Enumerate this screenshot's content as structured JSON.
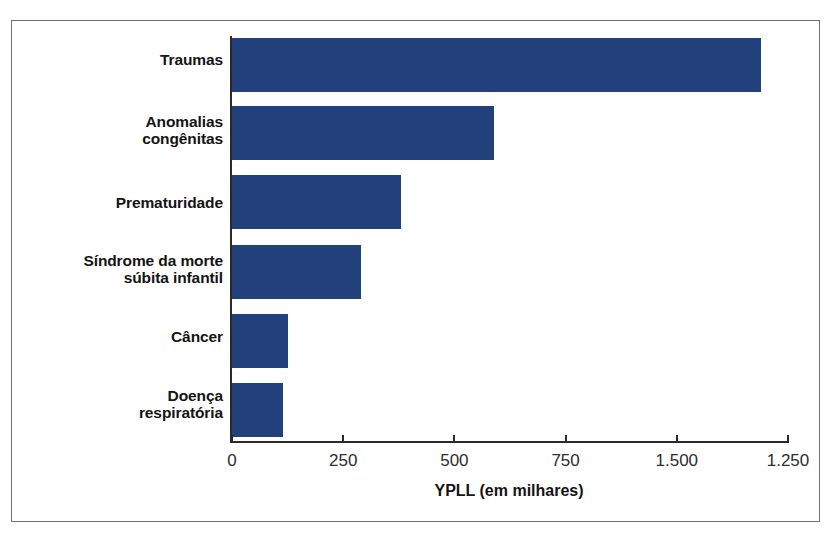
{
  "chart_data": {
    "type": "bar",
    "orientation": "horizontal",
    "title": "",
    "xlabel": "YPLL (em milhares)",
    "ylabel": "",
    "categories": [
      "Traumas",
      "Anomalias\ncongênitas",
      "Prematuridade",
      "Síndrome da morte\nsúbita infantil",
      "Câncer",
      "Doença\nrespiratória"
    ],
    "values": [
      1190,
      590,
      380,
      290,
      125,
      115
    ],
    "xlim": [
      0,
      1250
    ],
    "xticks": [
      0,
      250,
      500,
      750,
      1000,
      1250
    ],
    "xticklabels": [
      "0",
      "250",
      "500",
      "750",
      "1.500",
      "1.250"
    ],
    "grid": false,
    "legend": null,
    "bar_color": "#21407c",
    "axis_color": "#2a2a2a",
    "frame_color": "#6b7184",
    "note": "Tick label at the 1000 position is printed as '1.500' in the source figure."
  }
}
